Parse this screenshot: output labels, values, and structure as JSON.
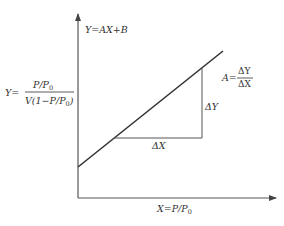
{
  "diagram": {
    "type": "linear-plot",
    "y_axis_equation": "Y=AX+B",
    "y_definition": {
      "lhs": "Y=",
      "numerator": "P/P",
      "numerator_sub": "0",
      "denominator_a": "V(1−P/P",
      "denominator_sub": "0",
      "denominator_b": ")"
    },
    "x_definition": {
      "text": "X=P/P",
      "sub": "0"
    },
    "slope": {
      "lhs": "A=",
      "numerator": "ΔY",
      "denominator": "ΔX"
    },
    "delta_y_label": "ΔY",
    "delta_x_label": "ΔX",
    "colors": {
      "line": "#333333",
      "axis": "#555555",
      "triangle": "#555555",
      "text": "#333333"
    }
  }
}
